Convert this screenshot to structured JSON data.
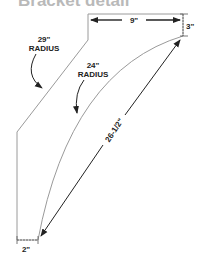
{
  "title": "Bracket detail",
  "labels": {
    "width_top": "9\"",
    "height_right": "3\"",
    "outer_radius_value": "29\"",
    "outer_radius_word": "RADIUS",
    "inner_radius_value": "24\"",
    "inner_radius_word": "RADIUS",
    "diagonal": "26-1/2\"",
    "bottom_width": "2\""
  },
  "colors": {
    "line": "#9a9a9a",
    "arrow": "#222222",
    "title": "#b9b9b9"
  }
}
